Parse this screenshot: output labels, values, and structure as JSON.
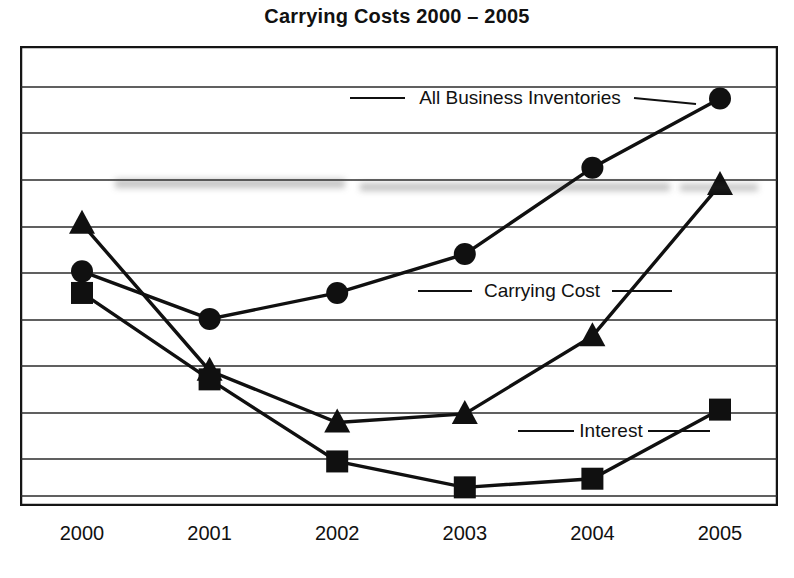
{
  "chart_data": {
    "type": "line",
    "title": "Carrying Costs 2000 – 2005",
    "xlabel": "",
    "ylabel": "",
    "grid": true,
    "gridlines": 10,
    "legend_position": "inline-annotations",
    "categories": [
      "2000",
      "2001",
      "2002",
      "2003",
      "2004",
      "2005"
    ],
    "x": [
      2000,
      2001,
      2002,
      2003,
      2004,
      2005
    ],
    "ylim": [
      0,
      10
    ],
    "yticks": [
      0,
      1,
      2,
      3,
      4,
      5,
      6,
      7,
      8,
      9,
      10
    ],
    "series": [
      {
        "name": "All Business Inventories",
        "marker": "circle",
        "values": [
          5.2,
          4.1,
          4.7,
          5.6,
          7.6,
          9.2
        ]
      },
      {
        "name": "Carrying Cost",
        "marker": "triangle",
        "values": [
          6.3,
          2.9,
          1.7,
          1.9,
          3.7,
          7.2
        ]
      },
      {
        "name": "Interest",
        "marker": "square",
        "values": [
          4.7,
          2.7,
          0.8,
          0.2,
          0.4,
          2.0
        ]
      }
    ],
    "annotations": [
      {
        "text": "All Business Inventories",
        "series": "All Business Inventories"
      },
      {
        "text": "Carrying Cost",
        "series": "All Business Inventories"
      },
      {
        "text": "Interest",
        "series": "Interest"
      }
    ]
  },
  "axis": {
    "x_tick_labels": [
      "2000",
      "2001",
      "2002",
      "2003",
      "2004",
      "2005"
    ]
  },
  "labels": {
    "all_business_inventories": "All Business Inventories",
    "carrying_cost": "Carrying Cost",
    "interest": "Interest"
  },
  "colors": {
    "ink": "#111111",
    "grid": "#2b2b2b",
    "background": "#ffffff"
  }
}
